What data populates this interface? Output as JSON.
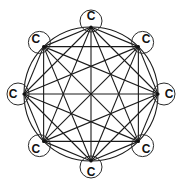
{
  "diagram": {
    "type": "complete-graph",
    "node_count": 8,
    "center": [
      91,
      94
    ],
    "ring_radius": 67,
    "node_circle_radius": 11,
    "colors": {
      "stroke": "#1a1a1a",
      "background": "#ffffff"
    },
    "nodes": [
      {
        "id": "n0",
        "label": "C",
        "position": "top"
      },
      {
        "id": "n1",
        "label": "C",
        "position": "top-right"
      },
      {
        "id": "n2",
        "label": "C",
        "position": "right"
      },
      {
        "id": "n3",
        "label": "C",
        "position": "bottom-right"
      },
      {
        "id": "n4",
        "label": "C",
        "position": "bottom"
      },
      {
        "id": "n5",
        "label": "C",
        "position": "bottom-left"
      },
      {
        "id": "n6",
        "label": "C",
        "position": "left"
      },
      {
        "id": "n7",
        "label": "C",
        "position": "top-left"
      }
    ],
    "edges": "all-pairs"
  }
}
